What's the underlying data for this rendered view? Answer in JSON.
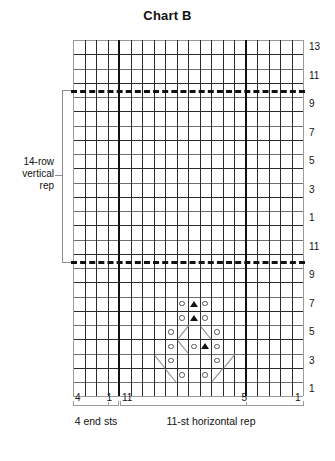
{
  "title": "Chart B",
  "chart_data": {
    "type": "table",
    "title": "Chart B",
    "grid": {
      "columns": 20,
      "rows": 25,
      "cell_width": 11.5,
      "cell_height": 14.25,
      "left": 73,
      "top": 40
    },
    "bold_column_dividers": [
      4,
      15
    ],
    "dashed_repeat_rows": [
      21.5,
      9.5
    ],
    "right_row_labels": [
      {
        "row": 13,
        "label": "13"
      },
      {
        "row": 11,
        "label": "11"
      },
      {
        "row": 9,
        "label": "9"
      },
      {
        "row": 7,
        "label": "7"
      },
      {
        "row": 5,
        "label": "5"
      },
      {
        "row": 3,
        "label": "3"
      },
      {
        "row": 1,
        "label": "1"
      },
      {
        "row": 11,
        "label": "11"
      },
      {
        "row": 9,
        "label": "9"
      },
      {
        "row": 7,
        "label": "7"
      },
      {
        "row": 5,
        "label": "5"
      },
      {
        "row": 3,
        "label": "3"
      },
      {
        "row": 1,
        "label": "1"
      }
    ],
    "column_labels": [
      {
        "text": "4",
        "col": 0
      },
      {
        "text": "1",
        "col": 3
      },
      {
        "text": "11",
        "col": 4
      },
      {
        "text": "5",
        "col": 10
      },
      {
        "text": "1",
        "col": 14
      }
    ],
    "symbols": [
      {
        "type": "circle",
        "col": 9,
        "row": 7
      },
      {
        "type": "triangle",
        "col": 10,
        "row": 7
      },
      {
        "type": "circle",
        "col": 11,
        "row": 7
      },
      {
        "type": "circle",
        "col": 9,
        "row": 6
      },
      {
        "type": "triangle",
        "col": 10,
        "row": 6
      },
      {
        "type": "circle",
        "col": 11,
        "row": 6
      },
      {
        "type": "circle",
        "col": 8,
        "row": 5
      },
      {
        "type": "diag-up",
        "col": 9,
        "row": 5
      },
      {
        "type": "diag-dn",
        "col": 11,
        "row": 5
      },
      {
        "type": "circle",
        "col": 12,
        "row": 5
      },
      {
        "type": "circle",
        "col": 8,
        "row": 4
      },
      {
        "type": "diag-dn",
        "col": 9,
        "row": 4
      },
      {
        "type": "circle",
        "col": 10,
        "row": 4
      },
      {
        "type": "triangle",
        "col": 11,
        "row": 4
      },
      {
        "type": "circle",
        "col": 12,
        "row": 4
      },
      {
        "type": "diag-dn",
        "col": 7,
        "row": 3
      },
      {
        "type": "circle",
        "col": 8,
        "row": 3
      },
      {
        "type": "circle",
        "col": 12,
        "row": 3
      },
      {
        "type": "diag-up",
        "col": 13,
        "row": 3
      },
      {
        "type": "diag-dn",
        "col": 8,
        "row": 2
      },
      {
        "type": "circle",
        "col": 9,
        "row": 2
      },
      {
        "type": "circle",
        "col": 11,
        "row": 2
      },
      {
        "type": "diag-up",
        "col": 12,
        "row": 2
      }
    ]
  },
  "annotations": {
    "vertical_rep": "14-row\nvertical\nrep",
    "end_sts": "4 end sts",
    "horizontal_rep": "11-st horizontal rep"
  }
}
